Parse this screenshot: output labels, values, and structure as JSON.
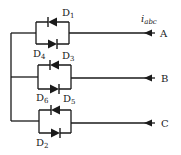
{
  "diagram": {
    "type": "three-phase diode circuit",
    "current_label": {
      "main": "i",
      "sub": "abc"
    },
    "phases": [
      {
        "name": "A",
        "top_diode": {
          "prefix": "D",
          "sub": "1"
        },
        "bottom_diode": {
          "prefix": "D",
          "sub": "4"
        }
      },
      {
        "name": "B",
        "top_diode": {
          "prefix": "D",
          "sub": "3"
        },
        "bottom_diode": {
          "prefix": "D",
          "sub": "6"
        }
      },
      {
        "name": "C",
        "top_diode": {
          "prefix": "D",
          "sub": "5"
        },
        "bottom_diode": {
          "prefix": "D",
          "sub": "2"
        }
      }
    ],
    "colors": {
      "line": "#1a1a1a",
      "background": "#ffffff"
    }
  }
}
